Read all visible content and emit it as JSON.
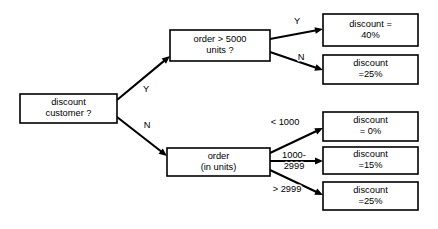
{
  "diagram": {
    "type": "decision-tree",
    "title": "",
    "background_color": "#ffffff",
    "line_color": "#000000",
    "box_fill_color": "#ffffff",
    "nodes": [
      {
        "id": "root",
        "kind": "decision",
        "line1": "discount",
        "line2": "customer ?",
        "x": 20,
        "y": 94,
        "w": 97,
        "h": 29
      },
      {
        "id": "order-gt-5000",
        "kind": "decision",
        "line1": "order > 5000",
        "line2": "units ?",
        "x": 170,
        "y": 30,
        "w": 100,
        "h": 31
      },
      {
        "id": "order-in-units",
        "kind": "decision",
        "line1": "order",
        "line2": "(in units)",
        "x": 167,
        "y": 148,
        "w": 103,
        "h": 28
      },
      {
        "id": "discount-40",
        "kind": "outcome",
        "line1": "discount =",
        "line2": "40%",
        "x": 323,
        "y": 14,
        "w": 95,
        "h": 32
      },
      {
        "id": "discount-25-top",
        "kind": "outcome",
        "line1": "discount",
        "line2": "=25%",
        "x": 323,
        "y": 55,
        "w": 95,
        "h": 29
      },
      {
        "id": "discount-0",
        "kind": "outcome",
        "line1": "discount",
        "line2": "= 0%",
        "x": 323,
        "y": 112,
        "w": 95,
        "h": 29
      },
      {
        "id": "discount-15",
        "kind": "outcome",
        "line1": "discount",
        "line2": "=15%",
        "x": 323,
        "y": 147,
        "w": 95,
        "h": 27
      },
      {
        "id": "discount-25-bottom",
        "kind": "outcome",
        "line1": "discount",
        "line2": "=25%",
        "x": 323,
        "y": 182,
        "w": 95,
        "h": 28
      }
    ],
    "edges": [
      {
        "id": "root-yes",
        "from": "root",
        "to": "order-gt-5000",
        "label": "Y",
        "label_x": 146,
        "label_y": 90,
        "x1": 117,
        "y1": 100,
        "x2": 170,
        "y2": 56,
        "arrow": true
      },
      {
        "id": "root-no",
        "from": "root",
        "to": "order-in-units",
        "label": "N",
        "label_x": 147,
        "label_y": 126,
        "x1": 117,
        "y1": 117,
        "x2": 167,
        "y2": 156,
        "arrow": true
      },
      {
        "id": "order5000-yes",
        "from": "order-gt-5000",
        "to": "discount-40",
        "label": "Y",
        "label_x": 297,
        "label_y": 22,
        "x1": 270,
        "y1": 39,
        "x2": 323,
        "y2": 29,
        "arrow": true
      },
      {
        "id": "order5000-no",
        "from": "order-gt-5000",
        "to": "discount-25-top",
        "label": "N",
        "label_x": 301,
        "label_y": 58,
        "x1": 270,
        "y1": 52,
        "x2": 323,
        "y2": 70,
        "arrow": true
      },
      {
        "id": "order-lt-1000",
        "from": "order-in-units",
        "to": "discount-0",
        "label": "< 1000",
        "label_x": 285,
        "label_y": 123,
        "x1": 270,
        "y1": 153,
        "x2": 323,
        "y2": 128,
        "arrow": true
      },
      {
        "id": "order-1000-2999",
        "from": "order-in-units",
        "to": "discount-15",
        "label_line1": "1000-",
        "label_line2": "2999",
        "label_x": 294,
        "label_y": 161,
        "x1": 270,
        "y1": 161,
        "x2": 323,
        "y2": 161,
        "arrow": true
      },
      {
        "id": "order-gt-2999",
        "from": "order-in-units",
        "to": "discount-25-bottom",
        "label": "> 2999",
        "label_x": 287,
        "label_y": 190,
        "x1": 270,
        "y1": 170,
        "x2": 323,
        "y2": 195,
        "arrow": true
      }
    ]
  }
}
